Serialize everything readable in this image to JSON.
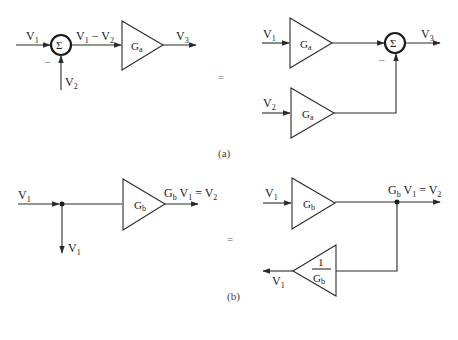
{
  "figure": {
    "part_a": {
      "caption": "(a)",
      "left": {
        "input1": {
          "main": "V",
          "sub": "1"
        },
        "input2": {
          "main": "V",
          "sub": "2"
        },
        "sum_symbol": "Σ",
        "minus_sign": "–",
        "difference": {
          "a": "V",
          "a_sub": "1",
          "op": " − ",
          "b": "V",
          "b_sub": "2"
        },
        "amp_gain": {
          "main": "G",
          "sub": "a"
        },
        "output": {
          "main": "V",
          "sub": "3"
        }
      },
      "equals": "=",
      "right": {
        "input1": {
          "main": "V",
          "sub": "1"
        },
        "input2": {
          "main": "V",
          "sub": "2"
        },
        "amp1_gain": {
          "main": "G",
          "sub": "a"
        },
        "amp2_gain": {
          "main": "G",
          "sub": "a"
        },
        "sum_symbol": "Σ",
        "minus_sign": "–",
        "output": {
          "main": "V",
          "sub": "3"
        }
      }
    },
    "part_b": {
      "caption": "(b)",
      "left": {
        "input": {
          "main": "V",
          "sub": "1"
        },
        "branch_output": {
          "main": "V",
          "sub": "1"
        },
        "amp_gain": {
          "main": "G",
          "sub": "b"
        },
        "output": {
          "g": "G",
          "g_sub": "b",
          "v": " V",
          "v_sub": "1",
          "eq": " = V",
          "r_sub": "2"
        }
      },
      "equals": "=",
      "right": {
        "input": {
          "main": "V",
          "sub": "1"
        },
        "amp_gain": {
          "main": "G",
          "sub": "b"
        },
        "output": {
          "g": "G",
          "g_sub": "b",
          "v": " V",
          "v_sub": "1",
          "eq": " = V",
          "r_sub": "2"
        },
        "feedback_gain": {
          "num": "1",
          "den": "G",
          "den_sub": "b"
        },
        "feedback_output": {
          "main": "V",
          "sub": "1"
        }
      }
    }
  }
}
